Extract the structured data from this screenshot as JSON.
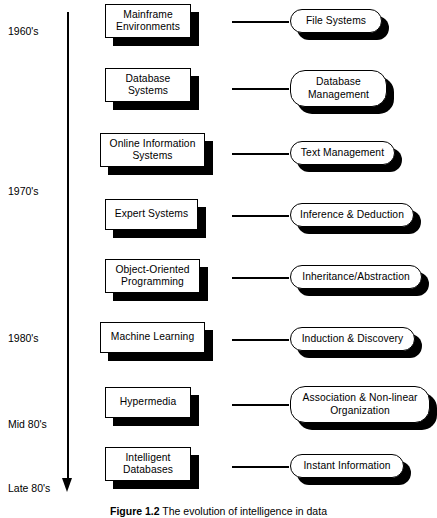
{
  "figure": {
    "caption_label": "Figure 1.2",
    "caption_text": "The evolution of intelligence in data"
  },
  "axis": {
    "name": "time-axis",
    "direction": "downward",
    "era_labels": [
      {
        "text": "1960's",
        "top": 25
      },
      {
        "text": "1970's",
        "top": 185
      },
      {
        "text": "1980's",
        "top": 332
      },
      {
        "text": "Mid 80's",
        "top": 418
      },
      {
        "text": "Late 80's",
        "top": 482
      }
    ]
  },
  "rows": [
    {
      "id": "mainframe-environments",
      "technology": "Mainframe\nEnvironments",
      "capability": "File Systems",
      "box": {
        "left": 105,
        "top": 4,
        "width": 86,
        "height": 34
      },
      "connector": {
        "left": 232,
        "top": 21,
        "width": 57
      },
      "capsule": {
        "left": 290,
        "top": 9,
        "width": 92,
        "height": 24,
        "radius": 12
      }
    },
    {
      "id": "database-systems",
      "technology": "Database\nSystems",
      "capability": "Database\nManagement",
      "box": {
        "left": 105,
        "top": 68,
        "width": 86,
        "height": 34
      },
      "connector": {
        "left": 232,
        "top": 88,
        "width": 57
      },
      "capsule": {
        "left": 290,
        "top": 70,
        "width": 97,
        "height": 37,
        "radius": 15
      }
    },
    {
      "id": "online-information-systems",
      "technology": "Online Information\nSystems",
      "capability": "Text Management",
      "box": {
        "left": 100,
        "top": 133,
        "width": 105,
        "height": 34
      },
      "connector": {
        "left": 232,
        "top": 153,
        "width": 57
      },
      "capsule": {
        "left": 290,
        "top": 141,
        "width": 105,
        "height": 24,
        "radius": 12
      }
    },
    {
      "id": "expert-systems",
      "technology": "Expert Systems",
      "capability": "Inference & Deduction",
      "box": {
        "left": 105,
        "top": 199,
        "width": 93,
        "height": 31
      },
      "connector": {
        "left": 232,
        "top": 215,
        "width": 57
      },
      "capsule": {
        "left": 290,
        "top": 203,
        "width": 124,
        "height": 24,
        "radius": 12
      }
    },
    {
      "id": "object-oriented-programming",
      "technology": "Object-Oriented\nProgramming",
      "capability": "Inheritance/Abstraction",
      "box": {
        "left": 105,
        "top": 259,
        "width": 95,
        "height": 34
      },
      "connector": {
        "left": 232,
        "top": 277,
        "width": 57
      },
      "capsule": {
        "left": 290,
        "top": 265,
        "width": 132,
        "height": 24,
        "radius": 12
      }
    },
    {
      "id": "machine-learning",
      "technology": "Machine  Learning",
      "capability": "Induction & Discovery",
      "box": {
        "left": 100,
        "top": 322,
        "width": 105,
        "height": 31
      },
      "connector": {
        "left": 232,
        "top": 339,
        "width": 57
      },
      "capsule": {
        "left": 290,
        "top": 327,
        "width": 125,
        "height": 24,
        "radius": 12
      }
    },
    {
      "id": "hypermedia",
      "technology": "Hypermedia",
      "capability": "Association & Non-linear\nOrganization",
      "box": {
        "left": 105,
        "top": 387,
        "width": 86,
        "height": 31
      },
      "connector": {
        "left": 232,
        "top": 404,
        "width": 57
      },
      "capsule": {
        "left": 290,
        "top": 386,
        "width": 140,
        "height": 37,
        "radius": 15
      }
    },
    {
      "id": "intelligent-databases",
      "technology": "Intelligent\nDatabases",
      "capability": "Instant Information",
      "box": {
        "left": 105,
        "top": 447,
        "width": 86,
        "height": 34
      },
      "connector": {
        "left": 232,
        "top": 466,
        "width": 57
      },
      "capsule": {
        "left": 290,
        "top": 454,
        "width": 114,
        "height": 24,
        "radius": 12
      }
    }
  ]
}
